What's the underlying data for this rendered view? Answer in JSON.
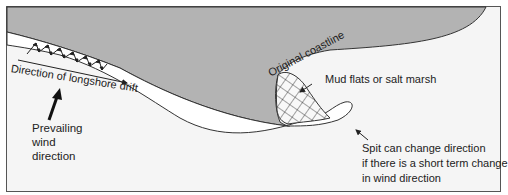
{
  "diagram": {
    "labels": {
      "longshore_drift": "Direction of longshore drift",
      "wind_line1": "Prevailing",
      "wind_line2": "wind",
      "wind_line3": "direction",
      "original_coastline": "Original coastline",
      "mud_flats": "Mud flats or salt marsh",
      "spit_line1": "Spit can change direction",
      "spit_line2": "if there is a short term change",
      "spit_line3": "in wind direction"
    },
    "colors": {
      "land": "#b3b3b3",
      "sea": "#f5f5f5",
      "beach": "#ffffff",
      "outline": "#333333"
    }
  }
}
